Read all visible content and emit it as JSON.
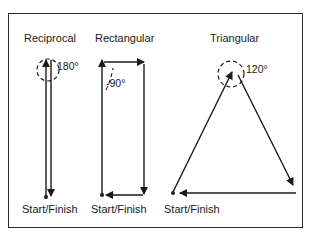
{
  "diagram": {
    "panels": [
      {
        "title": "Reciprocal",
        "angle_label": "180°",
        "start_label": "Start/Finish"
      },
      {
        "title": "Rectangular",
        "angle_label": "-90°",
        "start_label": "Start/Finish"
      },
      {
        "title": "Triangular",
        "angle_label": "120°",
        "start_label": "Start/Finish"
      }
    ],
    "colors": {
      "stroke": "#1a1a1a",
      "background": "#ffffff"
    }
  }
}
